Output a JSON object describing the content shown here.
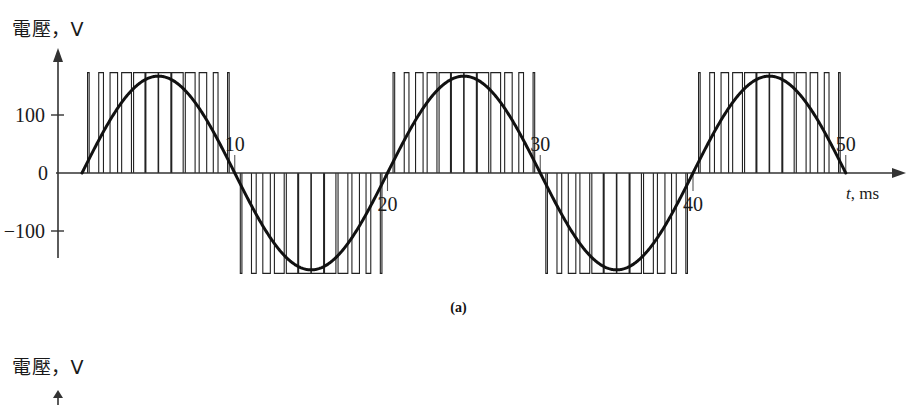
{
  "figure": {
    "caption_a": "(a)",
    "panel_a": {
      "y_axis_label": "電壓，V",
      "x_axis_label": "t, ms"
    },
    "panel_b": {
      "y_axis_label": "電壓，V"
    }
  },
  "chart_data": {
    "type": "line",
    "title": "",
    "subtitle": "",
    "xlabel": "t, ms",
    "ylabel": "電壓，V",
    "xlim": [
      0,
      53
    ],
    "ylim": [
      -190,
      190
    ],
    "grid": false,
    "legend": null,
    "annotations": [
      "(a)"
    ],
    "x_ticks": [
      10,
      20,
      30,
      40,
      50
    ],
    "x_tick_labels": [
      "10",
      "20",
      "30",
      "40",
      "50"
    ],
    "x_tick_label_side": [
      "above",
      "below",
      "above",
      "below",
      "above"
    ],
    "y_ticks": [
      -100,
      0,
      100
    ],
    "y_tick_labels": [
      "−100",
      "0",
      "100"
    ],
    "series": [
      {
        "name": "sine reference",
        "kind": "sine",
        "amplitude": 167,
        "period_ms": 20,
        "phase_deg": 0,
        "x_start": 0,
        "x_end": 50
      },
      {
        "name": "PWM output",
        "kind": "pwm",
        "amplitude": 173,
        "carrier_pulses_per_half_cycle": 12,
        "modulation_index": 0.97,
        "fundamental_period_ms": 20,
        "x_start": 0,
        "x_end": 50
      }
    ]
  }
}
